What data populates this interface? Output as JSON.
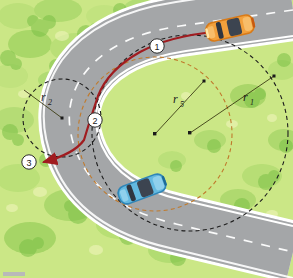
{
  "palette": {
    "grass_base": "#cbe786",
    "grass_light": "#e6f2b4",
    "grass_dark": "#8cc85f",
    "grass_mid": "#a9d86e",
    "road": "#a9abad",
    "road_dark": "#96989a",
    "road_edge_white": "#ffffff",
    "lane_dash": "#ffffff",
    "circle_black": "#1a1a1a",
    "circle_orange": "#c87a2a",
    "path_red": "#a01c20",
    "car_orange": "#f2a03c",
    "car_orange_dark": "#d87a18",
    "car_blue": "#63b9e0",
    "car_blue_dark": "#2f86b8",
    "car_glass": "#3c4450",
    "marker_fill": "#ffffff",
    "marker_stroke": "#2b2b2b",
    "leader_line": "#3c3c14"
  },
  "radii_labels": [
    {
      "id": "r1",
      "text": "r",
      "sub": "1",
      "x": 243,
      "y": 101
    },
    {
      "id": "r5",
      "text": "r",
      "sub": "5",
      "x": 175,
      "y": 105
    },
    {
      "id": "r2",
      "text": "r",
      "sub": "2",
      "x": 44,
      "y": 101
    }
  ],
  "markers": [
    {
      "id": "marker-1",
      "label": "1",
      "cx": 157,
      "cy": 46
    },
    {
      "id": "marker-2",
      "label": "2",
      "cx": 95,
      "cy": 120
    },
    {
      "id": "marker-3",
      "label": "3",
      "cx": 29,
      "cy": 162
    }
  ],
  "centers": [
    {
      "id": "center-r1",
      "cx": 190,
      "cy": 133
    },
    {
      "id": "center-r5",
      "cx": 155,
      "cy": 134
    },
    {
      "id": "center-r2",
      "cx": 62,
      "cy": 118
    }
  ],
  "radius_tips": [
    {
      "id": "tip-r1",
      "x": 274,
      "y": 76
    },
    {
      "id": "tip-r5",
      "x": 204,
      "y": 81
    },
    {
      "id": "tip-r2",
      "x": 24,
      "y": 90
    }
  ],
  "vehicles": [
    {
      "id": "car-orange",
      "color_key": "car_orange",
      "cx": 230,
      "cy": 28,
      "angle": -13
    },
    {
      "id": "car-blue",
      "color_key": "car_blue",
      "cx": 142,
      "cy": 189,
      "angle": -20
    }
  ],
  "arcs": {
    "outer_black_dashed": "large black dashed circle of radius r1 centred right of road",
    "inner_orange_dashed": "orange dashed circle of radius r5",
    "left_black_dashed": "small black dashed circle of radius r2 at left",
    "red_travel_path": "red line running from marker 1 through marker 2 to arrow at marker 3"
  }
}
